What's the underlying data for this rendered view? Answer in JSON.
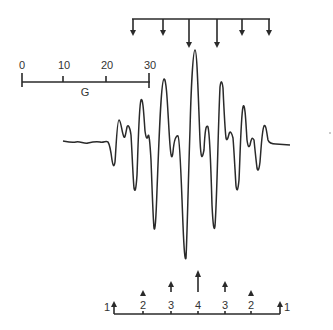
{
  "figure": {
    "type": "EPR spectrum",
    "ink_color": "#2a2a2a",
    "background": "#ffffff"
  },
  "scale_bar": {
    "unit_label": "G",
    "ticks": [
      {
        "label": "0",
        "value": 0
      },
      {
        "label": "10",
        "value": 10
      },
      {
        "label": "20",
        "value": 20
      },
      {
        "label": "30",
        "value": 30
      }
    ]
  },
  "top_stick_diagram": {
    "direction": "down",
    "lines": [
      {
        "x": 133,
        "length": 18
      },
      {
        "x": 163,
        "length": 18
      },
      {
        "x": 189,
        "length": 40
      },
      {
        "x": 217,
        "length": 40
      },
      {
        "x": 242,
        "length": 18
      },
      {
        "x": 269,
        "length": 18
      }
    ]
  },
  "bottom_stick_diagram": {
    "direction": "up",
    "intensity_labels": [
      "1",
      "2",
      "3",
      "4",
      "3",
      "2",
      "1"
    ],
    "lines": [
      {
        "x": 114,
        "rel_intensity": 1,
        "label": "1"
      },
      {
        "x": 143,
        "rel_intensity": 2,
        "label": "2"
      },
      {
        "x": 171,
        "rel_intensity": 3,
        "label": "3"
      },
      {
        "x": 198,
        "rel_intensity": 4,
        "label": "4"
      },
      {
        "x": 225,
        "rel_intensity": 3,
        "label": "3"
      },
      {
        "x": 251,
        "rel_intensity": 2,
        "label": "2"
      },
      {
        "x": 280,
        "rel_intensity": 1,
        "label": "1"
      }
    ]
  }
}
